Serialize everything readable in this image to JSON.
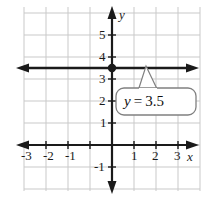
{
  "figure": {
    "name": "coordinate-plane-horizontal-line",
    "background_color": "#ffffff",
    "grid_color": "#c9c9c9",
    "axis_color": "#1a1a1a",
    "line_color": "#1a1a1a"
  },
  "axes": {
    "x_axis_label": "x",
    "y_axis_label": "y",
    "x_ticks": [
      "-3",
      "-2",
      "-1",
      "1",
      "2",
      "3"
    ],
    "x_tick_values": [
      -3,
      -2,
      -1,
      1,
      2,
      3
    ],
    "y_ticks": [
      "5",
      "4",
      "3",
      "2",
      "1",
      "-1"
    ],
    "y_tick_values": [
      5,
      4,
      3,
      2,
      1,
      -1
    ],
    "xlim": [
      -4,
      4
    ],
    "ylim": [
      -2,
      6
    ],
    "grid": true
  },
  "plot": {
    "equation_label": "y = 3.5",
    "equation_lhs": "y",
    "equation_op": "=",
    "equation_rhs": "3.5",
    "line_type": "horizontal",
    "line_y_value": 3.5,
    "intercept_point": [
      0,
      3.5
    ],
    "point_marker": "filled-dot",
    "arrows": "both-ends"
  },
  "callout": {
    "text": "y = 3.5",
    "fill": "#ffffff",
    "border": "#808080",
    "pointer_target": [
      1.55,
      3.5
    ]
  }
}
